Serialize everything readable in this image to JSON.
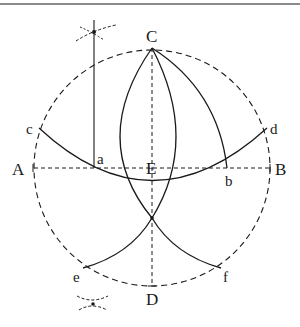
{
  "diagram": {
    "type": "geometric-construction",
    "colors": {
      "stroke": "#1a1a1a",
      "border": "#8a8a8a",
      "background": "#ffffff"
    },
    "labels": {
      "A": "A",
      "B": "B",
      "C": "C",
      "D": "D",
      "E": "E",
      "a": "a",
      "b": "b",
      "c": "c",
      "d": "d",
      "e": "e",
      "f": "f"
    },
    "points": {
      "center_E": [
        152,
        168
      ],
      "A": [
        33,
        168
      ],
      "B": [
        270,
        168
      ],
      "C": [
        152,
        48
      ],
      "D": [
        152,
        286
      ],
      "a": [
        94,
        168
      ],
      "b": [
        227,
        168
      ],
      "c": [
        39,
        128
      ],
      "d": [
        267,
        128
      ],
      "e": [
        83,
        268
      ],
      "f": [
        221,
        268
      ],
      "lower_intersection": [
        152,
        218
      ]
    },
    "radius": 118
  }
}
